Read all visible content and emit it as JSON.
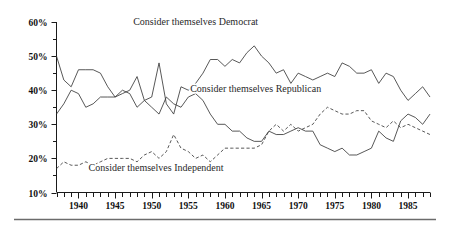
{
  "chart_data": {
    "type": "line",
    "title": "",
    "subtitle": "",
    "xlabel": "",
    "ylabel": "",
    "xlim": [
      1937,
      1988
    ],
    "ylim": [
      10,
      60
    ],
    "grid": false,
    "legend_position": "inline-annotations",
    "y_ticks": [
      10,
      20,
      30,
      40,
      50,
      60
    ],
    "y_tick_labels": [
      "10%",
      "20%",
      "30%",
      "40%",
      "50%",
      "60%"
    ],
    "y_minor_ticks": [
      15,
      25,
      35,
      45,
      55
    ],
    "x_ticks": [
      1940,
      1945,
      1950,
      1955,
      1960,
      1965,
      1970,
      1975,
      1980,
      1985
    ],
    "x_tick_labels": [
      "1940",
      "1945",
      "1950",
      "1955",
      "1960",
      "1965",
      "1970",
      "1975",
      "1980",
      "1985"
    ],
    "x_minor_tick_step": 1,
    "x": [
      1937,
      1938,
      1939,
      1940,
      1941,
      1942,
      1943,
      1944,
      1945,
      1946,
      1947,
      1948,
      1949,
      1950,
      1951,
      1952,
      1953,
      1954,
      1955,
      1956,
      1957,
      1958,
      1959,
      1960,
      1961,
      1962,
      1963,
      1964,
      1965,
      1966,
      1967,
      1968,
      1969,
      1970,
      1971,
      1972,
      1973,
      1974,
      1975,
      1976,
      1977,
      1978,
      1979,
      1980,
      1981,
      1982,
      1983,
      1984,
      1985,
      1986,
      1987,
      1988
    ],
    "series": [
      {
        "name": "Consider themselves Democrat",
        "style": "solid",
        "color": "#3a3a3a",
        "values": [
          50,
          43,
          41,
          46,
          46,
          46,
          45,
          41,
          38,
          39,
          40,
          44,
          37,
          38,
          48,
          36,
          33,
          41,
          40,
          42,
          45,
          49,
          49,
          47,
          49,
          48,
          51,
          53,
          50,
          48,
          45,
          46,
          42,
          45,
          44,
          43,
          44,
          45,
          44,
          48,
          47,
          45,
          45,
          46,
          42,
          45,
          44,
          40,
          37,
          39,
          41,
          38
        ]
      },
      {
        "name": "Consider themselves Republican",
        "style": "solid",
        "color": "#3a3a3a",
        "values": [
          33,
          36,
          40,
          39,
          35,
          36,
          38,
          38,
          38,
          40,
          39,
          35,
          37,
          35,
          33,
          38,
          36,
          35,
          38,
          39,
          37,
          33,
          30,
          30,
          28,
          28,
          26,
          25,
          25,
          28,
          27,
          27,
          28,
          29,
          28,
          28,
          24,
          23,
          22,
          23,
          21,
          21,
          22,
          23,
          28,
          26,
          25,
          31,
          33,
          32,
          30,
          33
        ]
      },
      {
        "name": "Consider themselves Independent",
        "style": "dashed",
        "color": "#3a3a3a",
        "values": [
          17,
          19,
          18,
          18,
          19,
          18,
          19,
          20,
          20,
          20,
          20,
          19,
          21,
          22,
          20,
          22,
          27,
          23,
          22,
          20,
          21,
          19,
          21,
          23,
          23,
          23,
          23,
          23,
          24,
          28,
          30,
          28,
          30,
          28,
          29,
          30,
          33,
          35,
          34,
          33,
          33,
          34,
          34,
          31,
          30,
          29,
          31,
          29,
          30,
          29,
          28,
          27
        ]
      }
    ],
    "annotations": [
      {
        "name": "democrat-label",
        "text": "Consider themselves Democrat",
        "x": 1956.0,
        "y": 59.0
      },
      {
        "name": "republican-label",
        "text": "Consider themselves Republican",
        "x": 1964.2,
        "y": 39.4
      },
      {
        "name": "independent-label",
        "text": "Consider themselves Independent",
        "x": 1950.6,
        "y": 16.3
      }
    ]
  },
  "figure": {
    "bottom_rule": true,
    "background": "#ffffff",
    "ink_color": "#3a3a3a"
  }
}
